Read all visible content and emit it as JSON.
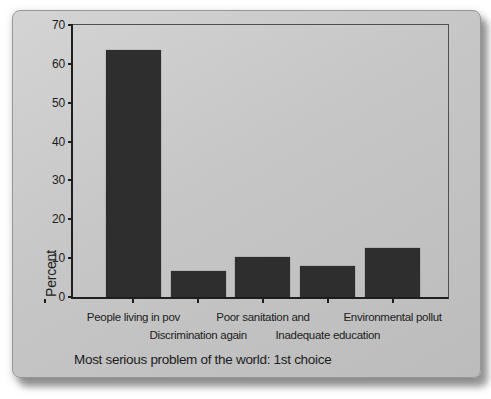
{
  "colors": {
    "bg": "#ffffff",
    "panel": "#c6c6c6",
    "bar": "#2e2e2e",
    "axis": "#1f1f1f",
    "frame": "#4f4f4f",
    "text": "#1c1c1c"
  },
  "chart_data": {
    "type": "bar",
    "title": "",
    "xlabel": "Most serious problem of the world: 1st choice",
    "ylabel": "Percent",
    "categories": [
      "People living in pov",
      "Discrimination again",
      "Poor sanitation and",
      "Inadequate education",
      "Environmental pollut"
    ],
    "values": [
      63.5,
      6.6,
      10.2,
      7.9,
      12.5
    ],
    "ylim": [
      0,
      70
    ],
    "yticks": [
      0,
      10,
      20,
      30,
      40,
      50,
      60,
      70
    ],
    "grid": false,
    "legend": false,
    "bar_color": "#2e2e2e",
    "label_rows": [
      1,
      2,
      1,
      2,
      1
    ]
  }
}
